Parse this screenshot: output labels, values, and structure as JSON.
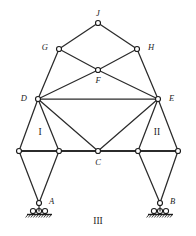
{
  "figure": {
    "type": "structural-truss-diagram",
    "width": 196,
    "height": 236,
    "background": "#ffffff",
    "line_color": "#2b2b2b",
    "joint_fill": "#ffffff",
    "joint_stroke": "#1d1d1d"
  },
  "nodes": {
    "J": {
      "label": "J",
      "x": 98,
      "y": 23,
      "label_x": 98,
      "label_y": 14,
      "anchor": "middle"
    },
    "G": {
      "label": "G",
      "x": 59,
      "y": 49,
      "label_x": 48,
      "label_y": 48,
      "anchor": "end"
    },
    "H": {
      "label": "H",
      "x": 137,
      "y": 49,
      "label_x": 148,
      "label_y": 48,
      "anchor": "start"
    },
    "F": {
      "label": "F",
      "x": 98,
      "y": 70,
      "label_x": 98,
      "label_y": 81,
      "anchor": "middle"
    },
    "D": {
      "label": "D",
      "x": 38,
      "y": 99,
      "label_x": 27,
      "label_y": 99,
      "anchor": "end"
    },
    "E": {
      "label": "E",
      "x": 158,
      "y": 99,
      "label_x": 169,
      "label_y": 99,
      "anchor": "start"
    },
    "C": {
      "label": "C",
      "x": 98,
      "y": 151,
      "label_x": 98,
      "label_y": 163,
      "anchor": "middle"
    },
    "L1": {
      "label": "",
      "x": 19,
      "y": 151,
      "label_x": 0,
      "label_y": 0,
      "anchor": "middle"
    },
    "L2": {
      "label": "",
      "x": 59,
      "y": 151,
      "label_x": 0,
      "label_y": 0,
      "anchor": "middle"
    },
    "R1": {
      "label": "",
      "x": 138,
      "y": 151,
      "label_x": 0,
      "label_y": 0,
      "anchor": "middle"
    },
    "R2": {
      "label": "",
      "x": 178,
      "y": 151,
      "label_x": 0,
      "label_y": 0,
      "anchor": "middle"
    },
    "A": {
      "label": "A",
      "x": 39,
      "y": 203,
      "label_x": 49,
      "label_y": 202,
      "anchor": "start"
    },
    "B": {
      "label": "B",
      "x": 160,
      "y": 203,
      "label_x": 170,
      "label_y": 202,
      "anchor": "start"
    }
  },
  "members": [
    {
      "name": "J-G",
      "from": "J",
      "to": "G",
      "weight": "thin"
    },
    {
      "name": "J-H",
      "from": "J",
      "to": "H",
      "weight": "thin"
    },
    {
      "name": "G-F",
      "from": "G",
      "to": "F",
      "weight": "thin"
    },
    {
      "name": "H-F",
      "from": "H",
      "to": "F",
      "weight": "thin"
    },
    {
      "name": "F-E",
      "from": "F",
      "to": "E",
      "weight": "thin"
    },
    {
      "name": "F-D",
      "from": "F",
      "to": "D",
      "weight": "thin"
    },
    {
      "name": "G-D",
      "from": "G",
      "to": "D",
      "weight": "thin"
    },
    {
      "name": "H-E",
      "from": "H",
      "to": "E",
      "weight": "thin"
    },
    {
      "name": "D-E",
      "from": "D",
      "to": "E",
      "weight": "thin"
    },
    {
      "name": "D-C",
      "from": "D",
      "to": "C",
      "weight": "thin"
    },
    {
      "name": "E-C",
      "from": "E",
      "to": "C",
      "weight": "thin"
    },
    {
      "name": "D-L1",
      "from": "D",
      "to": "L1",
      "weight": "thin"
    },
    {
      "name": "D-L2",
      "from": "D",
      "to": "L2",
      "weight": "thin"
    },
    {
      "name": "E-R1",
      "from": "E",
      "to": "R1",
      "weight": "thin"
    },
    {
      "name": "E-R2",
      "from": "E",
      "to": "R2",
      "weight": "thin"
    },
    {
      "name": "L1-A",
      "from": "L1",
      "to": "A",
      "weight": "thin"
    },
    {
      "name": "L2-A",
      "from": "L2",
      "to": "A",
      "weight": "thin"
    },
    {
      "name": "R1-B",
      "from": "R1",
      "to": "B",
      "weight": "thin"
    },
    {
      "name": "R2-B",
      "from": "R2",
      "to": "B",
      "weight": "thin"
    },
    {
      "name": "L1-L2",
      "from": "L1",
      "to": "L2",
      "weight": "thick"
    },
    {
      "name": "L2-C",
      "from": "L2",
      "to": "C",
      "weight": "thick"
    },
    {
      "name": "C-R1",
      "from": "C",
      "to": "R1",
      "weight": "thick"
    },
    {
      "name": "R1-R2",
      "from": "R1",
      "to": "R2",
      "weight": "thick"
    }
  ],
  "joint_radius": 2.5,
  "supports": [
    {
      "name": "support-a",
      "node": "A",
      "kind": "roller",
      "pin_x": 39,
      "pin_y": 203,
      "roller_y": 211,
      "roller_xs": [
        33,
        39,
        45
      ],
      "roller_r": 2.6,
      "ground_y": 214.5,
      "ground_x1": 27,
      "ground_x2": 52
    },
    {
      "name": "support-b",
      "node": "B",
      "kind": "roller",
      "pin_x": 160,
      "pin_y": 203,
      "roller_y": 211,
      "roller_xs": [
        154,
        160,
        166
      ],
      "roller_r": 2.6,
      "ground_y": 214.5,
      "ground_x1": 148,
      "ground_x2": 173
    }
  ],
  "region_labels": [
    {
      "name": "region-I",
      "text": "I",
      "x": 40,
      "y": 133
    },
    {
      "name": "region-II",
      "text": "II",
      "x": 157,
      "y": 133
    },
    {
      "name": "region-III",
      "text": "III",
      "x": 98,
      "y": 222
    }
  ]
}
